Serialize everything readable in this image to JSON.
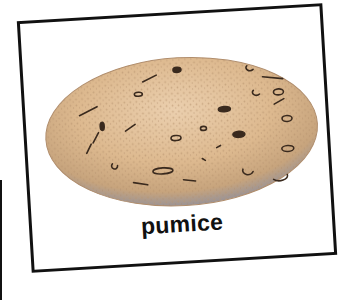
{
  "card": {
    "label": "pumice",
    "illustration": "pumice-stone",
    "colors": {
      "stone_light": "#e9c9a4",
      "stone_mid": "#d2ae84",
      "stone_shadow": "#8f8a8f",
      "border": "#111111"
    }
  }
}
